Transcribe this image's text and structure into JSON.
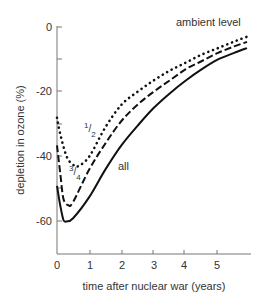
{
  "chart_data": {
    "type": "line",
    "title": "",
    "xlabel": "time after nuclear war (years)",
    "ylabel": "depletion in ozone (%)",
    "xlim": [
      0,
      6
    ],
    "ylim": [
      -70,
      0
    ],
    "xticks": [
      "0",
      "1",
      "2",
      "3",
      "4",
      "5"
    ],
    "yticks": [
      "0",
      "-20",
      "-40",
      "-60"
    ],
    "grid": false,
    "legend": "inline labels",
    "annotations": [
      {
        "text": "ambient level",
        "x": 5.0,
        "y": -1
      },
      {
        "text": "1/2",
        "x": 0.9,
        "y": -36
      },
      {
        "text": "3/4",
        "x": 0.55,
        "y": -47
      },
      {
        "text": "all",
        "x": 1.4,
        "y": -50
      }
    ],
    "series": [
      {
        "name": "1/2",
        "style": "dotted",
        "x": [
          0,
          0.1,
          0.3,
          0.5,
          0.65,
          1,
          1.5,
          2,
          2.5,
          3,
          3.5,
          4,
          4.5,
          5,
          5.5,
          5.9
        ],
        "y": [
          -28,
          -33,
          -40,
          -42.5,
          -43,
          -40,
          -31,
          -24,
          -20,
          -16.5,
          -13.5,
          -11,
          -8.5,
          -6.5,
          -4.5,
          -3
        ]
      },
      {
        "name": "3/4",
        "style": "dashed",
        "x": [
          0,
          0.1,
          0.2,
          0.35,
          0.5,
          1,
          1.5,
          2,
          2.5,
          3,
          3.5,
          4,
          4.5,
          5,
          5.5,
          5.9
        ],
        "y": [
          -36.5,
          -45,
          -53,
          -55,
          -54,
          -44,
          -36,
          -29,
          -24,
          -20,
          -16.5,
          -13,
          -10.5,
          -8,
          -6,
          -4.6
        ]
      },
      {
        "name": "all",
        "style": "solid",
        "x": [
          0,
          0.1,
          0.2,
          0.3,
          0.5,
          1,
          1.5,
          2,
          2.5,
          3,
          3.5,
          4,
          4.5,
          5,
          5.5,
          5.9
        ],
        "y": [
          -49,
          -55,
          -59.5,
          -60,
          -59,
          -52.5,
          -44,
          -36.5,
          -30.5,
          -25,
          -20.5,
          -16.5,
          -13,
          -10,
          -8,
          -6.5
        ]
      }
    ]
  },
  "labels": {
    "ambient": "ambient level",
    "half_num": "1",
    "half_den": "2",
    "threeq_num": "3",
    "threeq_den": "4",
    "all": "all",
    "xlabel": "time after nuclear war (years)",
    "ylabel": "depletion in ozone (%)",
    "yticks": [
      "0",
      "-20",
      "-40",
      "-60"
    ],
    "xticks": [
      "0",
      "1",
      "2",
      "3",
      "4",
      "5"
    ]
  }
}
